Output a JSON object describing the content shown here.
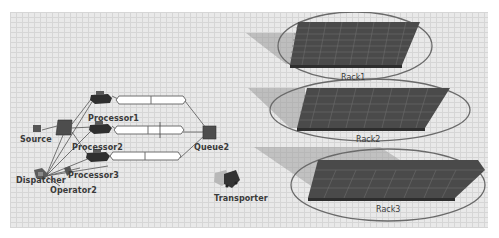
{
  "scene": {
    "background": "#e9e9e9",
    "grid_color": "#d6d6d6"
  },
  "objects": {
    "source": {
      "label": "Source",
      "icon": "source-box-icon"
    },
    "queue1": {
      "icon": "queue-box-icon"
    },
    "processor1": {
      "label": "Processor1",
      "icon": "processor-machine-icon"
    },
    "processor2": {
      "label": "Processor2",
      "icon": "processor-machine-icon"
    },
    "processor3": {
      "label": "Processor3",
      "icon": "processor-machine-icon"
    },
    "queue2": {
      "label": "Queue2",
      "icon": "queue-box-icon"
    },
    "dispatcher": {
      "label": "Dispatcher",
      "icon": "dispatcher-icon"
    },
    "operator2": {
      "label": "Operator2",
      "icon": "operator-person-icon"
    },
    "transporter": {
      "label": "Transporter",
      "icon": "forklift-icon"
    },
    "racks": [
      {
        "label": "Rack1",
        "icon": "rack-shelf-icon"
      },
      {
        "label": "Rack2",
        "icon": "rack-shelf-icon"
      },
      {
        "label": "Rack3",
        "icon": "rack-shelf-icon"
      }
    ],
    "conveyors": [
      {
        "name": "conveyor-1",
        "icon": "conveyor-icon"
      },
      {
        "name": "conveyor-2",
        "icon": "conveyor-icon"
      },
      {
        "name": "conveyor-3",
        "icon": "conveyor-icon"
      }
    ]
  },
  "colors": {
    "object_dark": "#3d3d3d",
    "rack_fill": "#4a4a4a",
    "rack_shadow": "#9a9a9a",
    "ellipse": "#6a6a6a",
    "conveyor_fill": "#ffffff",
    "conveyor_edge": "#6e6e6e",
    "link_line": "#555555"
  }
}
